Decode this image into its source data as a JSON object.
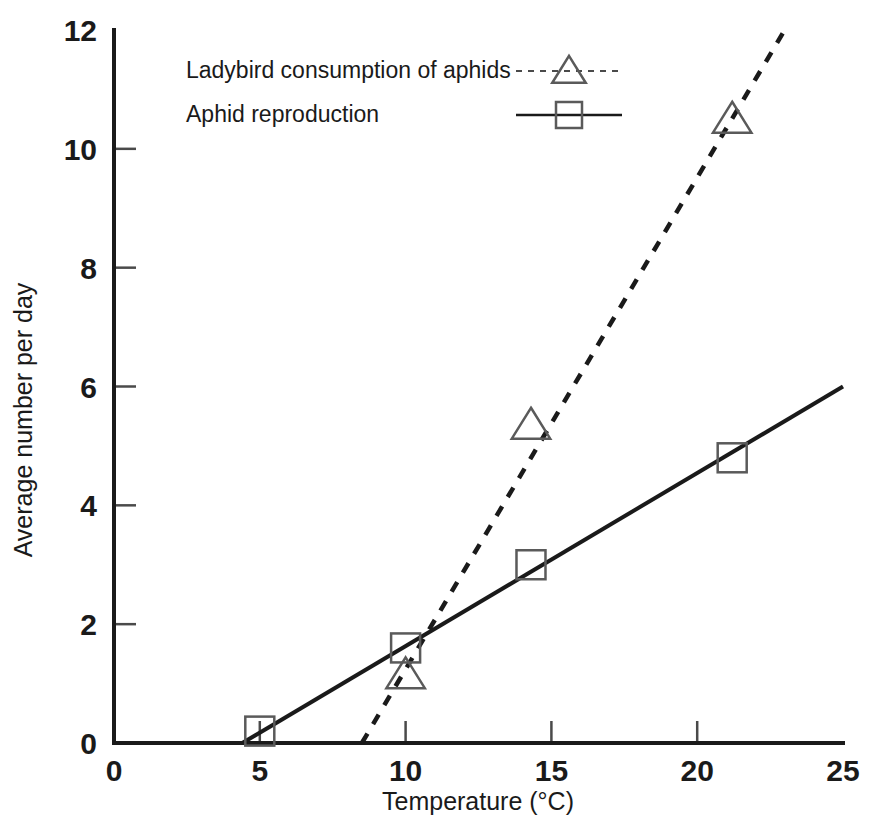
{
  "chart_data": {
    "type": "scatter",
    "title": "",
    "xlabel": "Temperature (°C)",
    "ylabel": "Average number per day",
    "xlim": [
      0,
      25
    ],
    "ylim": [
      0,
      12
    ],
    "xticks": [
      "0",
      "5",
      "10",
      "15",
      "20",
      "25"
    ],
    "yticks": [
      "0",
      "2",
      "4",
      "6",
      "8",
      "10",
      "12"
    ],
    "xtick_values": [
      0,
      5,
      10,
      15,
      20,
      25
    ],
    "ytick_values": [
      0,
      2,
      4,
      6,
      8,
      10,
      12
    ],
    "grid": false,
    "legend_position": "top-left-inside",
    "series": [
      {
        "name": "Ladybird consumption of aphids",
        "marker": "triangle",
        "linestyle": "dashed",
        "points": [
          {
            "x": 10.0,
            "y": 1.15
          },
          {
            "x": 14.3,
            "y": 5.35
          },
          {
            "x": 21.2,
            "y": 10.5
          }
        ],
        "fit_line": {
          "x0": 8.5,
          "y0": 0,
          "x1": 23.0,
          "y1": 12.0
        }
      },
      {
        "name": "Aphid reproduction",
        "marker": "square",
        "linestyle": "solid",
        "points": [
          {
            "x": 5.0,
            "y": 0.2
          },
          {
            "x": 10.0,
            "y": 1.6
          },
          {
            "x": 14.3,
            "y": 3.0
          },
          {
            "x": 21.2,
            "y": 4.8
          }
        ],
        "fit_line": {
          "x0": 4.4,
          "y0": 0,
          "x1": 25.0,
          "y1": 6.0
        }
      }
    ]
  },
  "legend": {
    "entries": [
      {
        "label": "Ladybird consumption of aphids",
        "marker": "triangle",
        "linestyle": "dashed"
      },
      {
        "label": "Aphid reproduction",
        "marker": "square",
        "linestyle": "solid"
      }
    ]
  },
  "colors": {
    "ink": "#1a1a1a",
    "marker_stroke": "#5a5a5a",
    "background": "#ffffff"
  }
}
